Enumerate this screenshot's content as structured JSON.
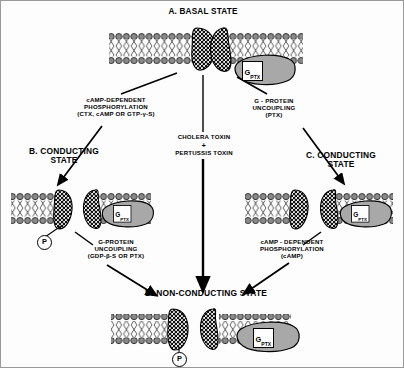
{
  "figure": {
    "title_a": "A.  BASAL STATE",
    "title_b": "B. CONDUCTING\nSTATE",
    "title_c": "C.  CONDUCTING\nSTATE",
    "title_d": "D.  NON-CONDUCTING STATE"
  },
  "transitions": {
    "a_to_b": "cAMP-DEPENDENT\nPHOSPHORYLATION\n(CTX,  cAMP OR GTP-γ-S)",
    "a_to_c": "G - PROTEIN\nUNCOUPLING\n(PTX)",
    "a_to_d_line1": "CHOLERA TOXIN",
    "a_to_d_plus": "+",
    "a_to_d_line2": "PERTUSSIS TOXIN",
    "b_to_d": "G-PROTEIN\nUNCOUPLING\n(GDP-β-S OR PTX)",
    "c_to_d": "cAMP -  DEPENDENT\nPHOSPHORYLATION\n(cAMP)"
  },
  "symbols": {
    "gprotein_label_main": "G",
    "gprotein_label_sub": "PTX",
    "phosphate_label": "P"
  },
  "colors": {
    "ink": "#000000",
    "membrane_head": "#7d7d7d",
    "gprotein_fill": "#a8a8a8",
    "background": "#fdfdfd"
  }
}
